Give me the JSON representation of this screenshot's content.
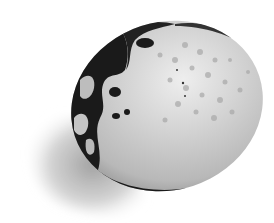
{
  "image": {
    "subject": "speckled egg",
    "description": "Grayscale illustration of a spotted egg lying on its side with a soft shadow to the lower left",
    "colors": {
      "background": "#ffffff",
      "shell_light": "#e6e6e6",
      "shell_mid": "#bdbdbd",
      "dark_patches": "#1a1a1a",
      "shadow": "#a9a9a9"
    }
  }
}
